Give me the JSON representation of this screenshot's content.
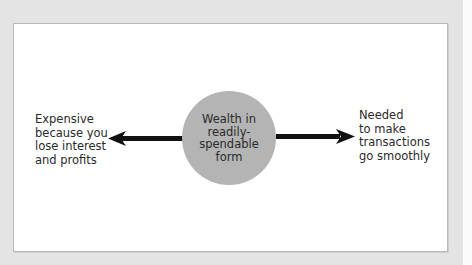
{
  "diagram": {
    "center": {
      "label": "Wealth in\nreadily-\nspendable\nform",
      "fill_color": "#b4b4b4"
    },
    "left": {
      "label": "Expensive\nbecause you\nlose interest\nand profits",
      "arrow_direction": "left"
    },
    "right": {
      "label": "Needed\nto make\ntransactions\ngo smoothly",
      "arrow_direction": "right"
    },
    "colors": {
      "background": "#e4e4e4",
      "panel": "#ffffff",
      "arrow": "#111111",
      "text": "#2a2a2a"
    }
  }
}
